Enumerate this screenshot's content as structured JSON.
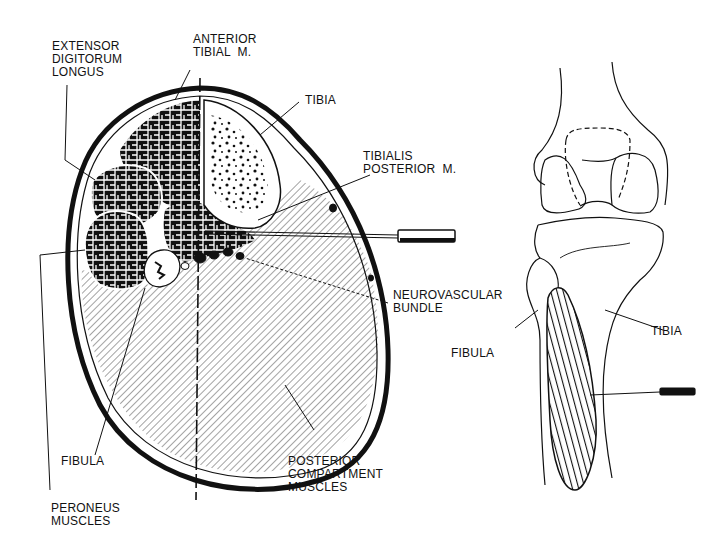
{
  "figure": {
    "cross_section": {
      "labels": {
        "extensor_digitorum_longus": "EXTENSOR\nDIGITORUM\nLONGUS",
        "anterior_tibial": "ANTERIOR\nTIBIAL  M.",
        "tibia": "TIBIA",
        "tibialis_posterior": "TIBIALIS\nPOSTERIOR  M.",
        "neurovascular_bundle": "NEUROVASCULAR\nBUNDLE",
        "fibula": "FIBULA",
        "peroneus_muscles": "PERONEUS\nMUSCLES",
        "posterior_compartment": "POSTERIOR\nCOMPARTMENT\nMUSCLES"
      }
    },
    "knee_view": {
      "labels": {
        "fibula": "FIBULA",
        "tibia": "TIBIA"
      }
    },
    "colors": {
      "ink": "#111111",
      "paper": "#ffffff"
    }
  }
}
